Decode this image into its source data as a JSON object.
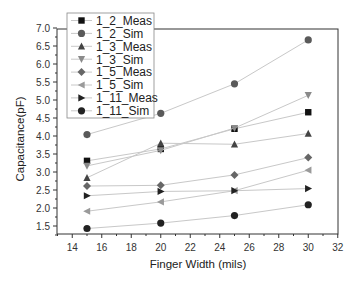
{
  "chart_data": {
    "type": "line",
    "title": "",
    "xlabel": "Finger Width (mils)",
    "ylabel": "Capacitance(pF)",
    "xlim": [
      13,
      32
    ],
    "ylim": [
      1.25,
      7.0
    ],
    "x_ticks": [
      14,
      16,
      18,
      20,
      22,
      24,
      26,
      28,
      30,
      32
    ],
    "y_ticks": [
      1.5,
      2.0,
      2.5,
      3.0,
      3.5,
      4.0,
      4.5,
      5.0,
      5.5,
      6.0,
      6.5,
      7.0
    ],
    "x_tick_labels": [
      "14",
      "16",
      "18",
      "20",
      "22",
      "24",
      "26",
      "28",
      "30",
      "32"
    ],
    "y_tick_labels": [
      "1.5",
      "2.0",
      "2.5",
      "3.0",
      "3.5",
      "4.0",
      "4.5",
      "5.0",
      "5.5",
      "6.0",
      "6.5",
      "7.0"
    ],
    "grid": false,
    "legend_position": "upper left",
    "x": [
      15,
      20,
      25,
      30
    ],
    "series": [
      {
        "name": "1_2_Meas",
        "marker": "square",
        "color": "#111111",
        "values": [
          3.31,
          3.64,
          4.2,
          4.66
        ]
      },
      {
        "name": "1_2_Sim",
        "marker": "circle",
        "color": "#5a5a5a",
        "values": [
          4.04,
          4.63,
          5.45,
          6.67
        ]
      },
      {
        "name": "1_3_Meas",
        "marker": "triangle-up",
        "color": "#444444",
        "values": [
          2.84,
          3.8,
          3.77,
          4.07
        ]
      },
      {
        "name": "1_3_Sim",
        "marker": "triangle-down",
        "color": "#8a8a8a",
        "values": [
          3.17,
          3.6,
          4.22,
          5.13
        ]
      },
      {
        "name": "1_5_Meas",
        "marker": "diamond",
        "color": "#666666",
        "values": [
          2.61,
          2.63,
          2.92,
          3.4
        ]
      },
      {
        "name": "1_5_Sim",
        "marker": "triangle-left",
        "color": "#9a9a9a",
        "values": [
          1.91,
          2.17,
          2.48,
          3.05
        ]
      },
      {
        "name": "1_11_Meas",
        "marker": "triangle-right",
        "color": "#222222",
        "values": [
          2.34,
          2.46,
          2.48,
          2.54
        ]
      },
      {
        "name": "1_11_Sim",
        "marker": "circle",
        "color": "#222222",
        "values": [
          1.43,
          1.58,
          1.79,
          2.09
        ]
      }
    ]
  },
  "line_color": "#c8c8c8",
  "axis_color": "#333333"
}
